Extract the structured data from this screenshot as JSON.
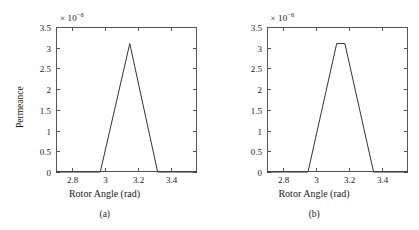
{
  "figure": {
    "panels": [
      {
        "caption": "(a)",
        "xlabel": "Rotor Angle (rad)",
        "ylabel": "Permeance",
        "exponent_prefix": "× 10",
        "exponent_power": "−6"
      },
      {
        "caption": "(b)",
        "xlabel": "Rotor Angle (rad)",
        "ylabel": "",
        "exponent_prefix": "× 10",
        "exponent_power": "−6"
      }
    ],
    "line_color": "#333333",
    "axis_color": "#555555",
    "background_color": "#ffffff"
  },
  "chart_data": [
    {
      "type": "line",
      "title": "",
      "subtitle": "(a)",
      "xlabel": "Rotor Angle (rad)",
      "ylabel": "Permeance",
      "y_exponent": -6,
      "y_exponent_label": "× 10⁻⁶",
      "xlim": [
        2.7,
        3.56
      ],
      "ylim": [
        0,
        3.5e-06
      ],
      "xticks": [
        2.8,
        3.0,
        3.2,
        3.4
      ],
      "xticklabels": [
        "2.8",
        "3",
        "3.2",
        "3.4"
      ],
      "yticks": [
        0,
        5e-07,
        1e-06,
        1.5e-06,
        2e-06,
        2.5e-06,
        3e-06,
        3.5e-06
      ],
      "yticklabels": [
        "0",
        "0.5",
        "1",
        "1.5",
        "2",
        "2.5",
        "3",
        "3.5"
      ],
      "grid": false,
      "legend": null,
      "series": [
        {
          "name": "Permeance",
          "x": [
            2.7,
            2.97,
            3.15,
            3.32,
            3.56
          ],
          "y": [
            0,
            0,
            3.1e-06,
            0,
            0
          ]
        }
      ]
    },
    {
      "type": "line",
      "title": "",
      "subtitle": "(b)",
      "xlabel": "Rotor Angle (rad)",
      "ylabel": "",
      "y_exponent": -6,
      "y_exponent_label": "× 10⁻⁶",
      "xlim": [
        2.7,
        3.56
      ],
      "ylim": [
        0,
        3.5e-06
      ],
      "xticks": [
        2.8,
        3.0,
        3.2,
        3.4
      ],
      "xticklabels": [
        "2.8",
        "3",
        "3.2",
        "3.4"
      ],
      "yticks": [
        0,
        5e-07,
        1e-06,
        1.5e-06,
        2e-06,
        2.5e-06,
        3e-06,
        3.5e-06
      ],
      "yticklabels": [
        "0",
        "0.5",
        "1",
        "1.5",
        "2",
        "2.5",
        "3",
        "3.5"
      ],
      "grid": false,
      "legend": null,
      "series": [
        {
          "name": "Permeance",
          "x": [
            2.7,
            2.95,
            3.125,
            3.175,
            3.35,
            3.56
          ],
          "y": [
            0,
            0,
            3.1e-06,
            3.1e-06,
            0,
            0
          ]
        }
      ]
    }
  ]
}
